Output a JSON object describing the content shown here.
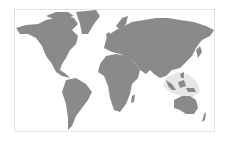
{
  "map": {
    "type": "world-map",
    "projection": "equirectangular",
    "land_color": "#8a8a8a",
    "background_color": "#ffffff",
    "border_color": "#e2e2e2",
    "highlight": {
      "region": "Maritime Southeast Asia",
      "color": "#e6e6e6"
    }
  }
}
